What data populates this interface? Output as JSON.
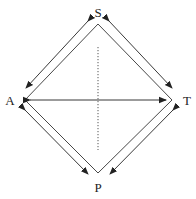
{
  "diagram": {
    "type": "diamond-relationship",
    "stroke_color": "#222222",
    "nodes": [
      {
        "id": "S",
        "label": "S",
        "position": "top",
        "x": 98,
        "y": 12
      },
      {
        "id": "A",
        "label": "A",
        "position": "left",
        "x": 10,
        "y": 100
      },
      {
        "id": "T",
        "label": "T",
        "position": "right",
        "x": 187,
        "y": 100
      },
      {
        "id": "P",
        "label": "P",
        "position": "bottom",
        "x": 98,
        "y": 187
      }
    ],
    "edges": [
      {
        "from": "S",
        "to": "A",
        "style": "solid-line",
        "bidirectional_arrow_parallel": true
      },
      {
        "from": "S",
        "to": "T",
        "style": "solid-line",
        "bidirectional_arrow_parallel": true
      },
      {
        "from": "A",
        "to": "P",
        "style": "solid-line",
        "bidirectional_arrow_parallel": true
      },
      {
        "from": "T",
        "to": "P",
        "style": "solid-line",
        "bidirectional_arrow_parallel": true
      },
      {
        "from": "A",
        "to": "T",
        "style": "double-headed-arrow"
      },
      {
        "from": "S",
        "to": "P",
        "style": "dotted-line",
        "partial": true
      }
    ]
  }
}
